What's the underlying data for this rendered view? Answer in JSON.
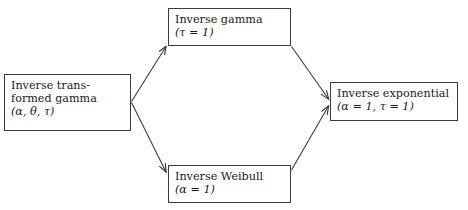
{
  "diagram": {
    "type": "flow-diagram",
    "background_color": "#ffffff",
    "line_color": "#3b3b3b",
    "text_color": "#1a1a1a",
    "nodes": [
      {
        "id": "inverse-transformed-gamma",
        "line1": "Inverse trans-",
        "line2": "formed gamma",
        "line3": "(α, θ, τ)"
      },
      {
        "id": "inverse-gamma",
        "line1": "Inverse gamma",
        "line2": "(τ = 1)"
      },
      {
        "id": "inverse-weibull",
        "line1": "Inverse Weibull",
        "line2": "(α = 1)"
      },
      {
        "id": "inverse-exponential",
        "line1": "Inverse exponential",
        "line2": "(α = 1, τ = 1)"
      }
    ],
    "edges": [
      {
        "id": "edge-itg-to-ig",
        "from": "inverse-transformed-gamma",
        "to": "inverse-gamma",
        "label": ""
      },
      {
        "id": "edge-itg-to-iw",
        "from": "inverse-transformed-gamma",
        "to": "inverse-weibull",
        "label": ""
      },
      {
        "id": "edge-ig-to-ie",
        "from": "inverse-gamma",
        "to": "inverse-exponential",
        "label": ""
      },
      {
        "id": "edge-iw-to-ie",
        "from": "inverse-weibull",
        "to": "inverse-exponential",
        "label": ""
      }
    ]
  }
}
